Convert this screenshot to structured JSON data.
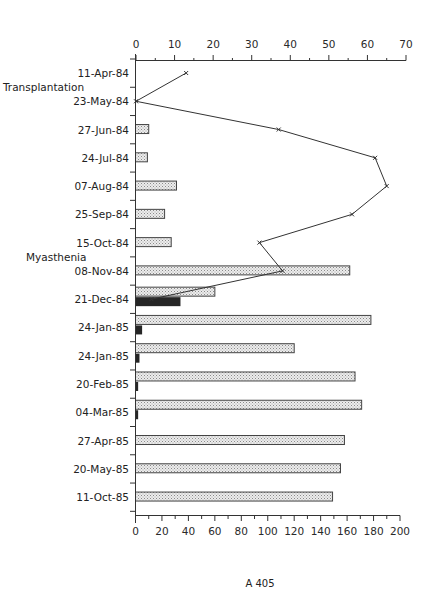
{
  "chart_data": {
    "type": "bar",
    "orientation": "horizontal",
    "title": "",
    "caption": "A 405",
    "categories": [
      "11-Apr-84",
      "23-May-84",
      "27-Jun-84",
      "24-Jul-84",
      "07-Aug-84",
      "25-Sep-84",
      "15-Oct-84",
      "08-Nov-84",
      "21-Dec-84",
      "24-Jan-85",
      "24-Jan-85",
      "20-Feb-85",
      "04-Mar-85",
      "27-Apr-85",
      "20-May-85",
      "11-Oct-85"
    ],
    "annotations": [
      {
        "text": "Transplantation",
        "between": [
          "11-Apr-84",
          "23-May-84"
        ]
      },
      {
        "text": "Myasthenia",
        "between": [
          "15-Oct-84",
          "08-Nov-84"
        ]
      }
    ],
    "bottom_axis": {
      "range": [
        0,
        200
      ],
      "ticks": [
        0,
        20,
        40,
        60,
        80,
        100,
        120,
        140,
        160,
        180,
        200
      ]
    },
    "top_axis": {
      "range": [
        0,
        70
      ],
      "ticks": [
        0,
        10,
        20,
        30,
        40,
        50,
        60,
        70
      ]
    },
    "series": [
      {
        "name": "stippled bars (bottom axis)",
        "type": "bar",
        "axis": "bottom",
        "values": [
          null,
          null,
          10,
          9,
          31,
          22,
          27,
          162,
          60,
          178,
          120,
          166,
          171,
          158,
          155,
          149
        ]
      },
      {
        "name": "dark bars (bottom axis)",
        "type": "bar",
        "axis": "bottom",
        "values": [
          null,
          null,
          null,
          null,
          null,
          null,
          null,
          null,
          34,
          5,
          3,
          2,
          2,
          null,
          null,
          null
        ]
      },
      {
        "name": "line (top axis)",
        "type": "line",
        "axis": "top",
        "marker": "x",
        "values": [
          13,
          0,
          37,
          62,
          65,
          56,
          32,
          38,
          4,
          null,
          null,
          null,
          null,
          null,
          null,
          null
        ]
      }
    ],
    "grid": false,
    "legend": null
  },
  "labels": {
    "rows": [
      "11-Apr-84",
      "23-May-84",
      "27-Jun-84",
      "24-Jul-84",
      "07-Aug-84",
      "25-Sep-84",
      "15-Oct-84",
      "08-Nov-84",
      "21-Dec-84",
      "24-Jan-85",
      "24-Jan-85",
      "20-Feb-85",
      "04-Mar-85",
      "27-Apr-85",
      "20-May-85",
      "11-Oct-85"
    ],
    "transplantation": "Transplantation",
    "myasthenia": "Myasthenia",
    "caption": "A 405"
  }
}
